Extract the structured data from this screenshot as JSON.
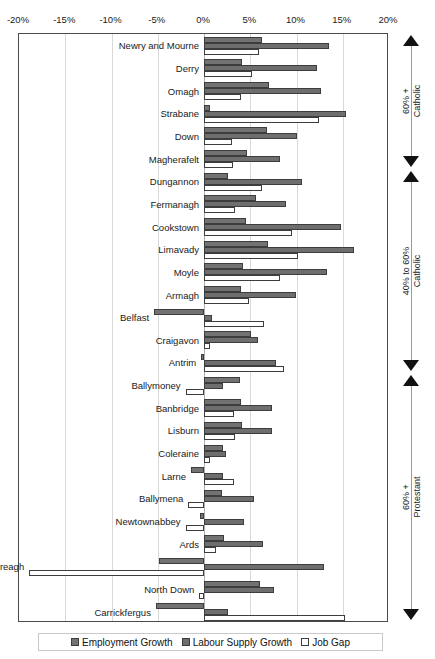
{
  "chart_data": {
    "type": "bar",
    "orientation": "horizontal",
    "title": "",
    "xlabel": "",
    "ylabel": "",
    "xlim": [
      -20,
      20
    ],
    "xticks": [
      -20,
      -15,
      -10,
      -5,
      0,
      5,
      10,
      15,
      20
    ],
    "xtick_labels": [
      "-20%",
      "-15%",
      "-10%",
      "-5%",
      "0%",
      "5%",
      "10%",
      "15%",
      "20%"
    ],
    "grid": true,
    "legend_position": "bottom",
    "legend": [
      "Employment Growth",
      "Labour Supply Growth",
      "Job Gap"
    ],
    "categories": [
      "Newry and Mourne",
      "Derry",
      "Omagh",
      "Strabane",
      "Down",
      "Magherafelt",
      "Dungannon",
      "Fermanagh",
      "Cookstown",
      "Limavady",
      "Moyle",
      "Armagh",
      "Belfast",
      "Craigavon",
      "Antrim",
      "Ballymoney",
      "Banbridge",
      "Lisburn",
      "Coleraine",
      "Larne",
      "Ballymena",
      "Newtownabbey",
      "Ards",
      "Castlereagh",
      "North Down",
      "Carrickfergus"
    ],
    "series": [
      {
        "name": "Employment Growth",
        "color": "#727272",
        "values": [
          6.3,
          4.1,
          7.0,
          0.6,
          6.8,
          4.6,
          2.6,
          5.6,
          4.5,
          6.9,
          4.2,
          4.0,
          -5.4,
          5.1,
          -0.3,
          3.9,
          4.0,
          4.1,
          2.1,
          -1.4,
          1.9,
          -0.4,
          2.2,
          -4.9,
          6.0,
          -5.2
        ]
      },
      {
        "name": "Labour Supply Growth",
        "color": "#6e6e6e",
        "values": [
          13.5,
          12.2,
          12.6,
          15.3,
          10.1,
          8.2,
          10.6,
          8.9,
          14.8,
          16.2,
          13.3,
          9.9,
          0.9,
          5.8,
          7.8,
          2.0,
          7.4,
          7.3,
          2.4,
          2.0,
          5.4,
          4.3,
          6.4,
          13.0,
          7.6,
          2.6
        ]
      },
      {
        "name": "Job Gap",
        "color": "#ffffff",
        "values": [
          5.9,
          5.2,
          4.0,
          12.4,
          3.0,
          3.1,
          6.3,
          3.3,
          9.5,
          10.2,
          8.2,
          4.9,
          6.5,
          0.7,
          8.6,
          -2.0,
          3.2,
          3.3,
          0.6,
          3.2,
          -1.7,
          -2.0,
          1.3,
          -18.9,
          -0.5,
          15.2
        ]
      }
    ],
    "annotations": [
      {
        "label_lines": [
          "60% +",
          "Catholic"
        ],
        "start_index": 0,
        "end_index": 5,
        "arrow_top": "up",
        "arrow_bottom": "down"
      },
      {
        "label_lines": [
          "40% to 60%",
          "Catholic"
        ],
        "start_index": 6,
        "end_index": 14,
        "arrow_top": "up",
        "arrow_bottom": "down"
      },
      {
        "label_lines": [
          "60% +",
          "Protestant"
        ],
        "start_index": 15,
        "end_index": 25,
        "arrow_top": "up",
        "arrow_bottom": "down"
      }
    ]
  }
}
